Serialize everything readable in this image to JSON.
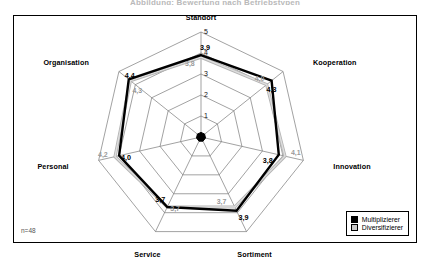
{
  "page": {
    "title": "Abbildung: Bewertung nach Betriebstypen",
    "sample_note": "n=48"
  },
  "legend": {
    "items": [
      {
        "label": "Multiplizierer",
        "color": "#000000"
      },
      {
        "label": "Diversifizierer",
        "color": "#c9c9c9"
      }
    ]
  },
  "axis_ticks": [
    "1",
    "2",
    "3",
    "4",
    "5"
  ],
  "chart_data": {
    "type": "radar",
    "title": "Abbildung: Bewertung nach Betriebstypen",
    "xlabel": "",
    "ylabel": "",
    "ylim": [
      0,
      5
    ],
    "grid": true,
    "legend_position": "bottom-right",
    "tick_labels": [
      "1",
      "2",
      "3",
      "4",
      "5"
    ],
    "categories": [
      "Standort",
      "Kooperation",
      "Innovation",
      "Sortiment",
      "Service",
      "Personal",
      "Organisation"
    ],
    "series": [
      {
        "name": "Multiplizierer",
        "color": "#000000",
        "values": [
          3.9,
          4.3,
          3.8,
          3.9,
          3.7,
          4.0,
          4.4
        ],
        "labels": [
          "3,9",
          "4,3",
          "3,8",
          "3,9",
          "3,7",
          "4,0",
          "4,4"
        ]
      },
      {
        "name": "Diversifizierer",
        "color": "#9a9a9a",
        "values": [
          3.8,
          4.0,
          4.1,
          3.7,
          3.7,
          4.2,
          4.3
        ],
        "labels": [
          "3,8",
          "4,0",
          "4,1",
          "3,7",
          "3,7",
          "4,2",
          "4,3"
        ]
      }
    ],
    "annotations": [
      "n=48"
    ]
  }
}
